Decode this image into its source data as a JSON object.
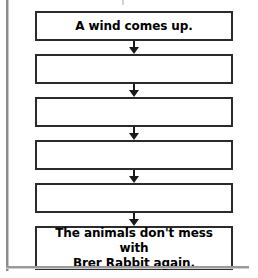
{
  "page": {
    "background_color": "#ffffff",
    "border_color": "#2b2b2b",
    "text_color": "#000000",
    "arrow_color": "#1a1a1a"
  },
  "flowchart": {
    "type": "vertical-sequence",
    "box_count": 6,
    "arrow_count": 5,
    "arrow_direction": "down",
    "boxes": [
      {
        "index": 1,
        "text": "A wind comes up.",
        "filled": true,
        "lines": 1
      },
      {
        "index": 2,
        "text": "",
        "filled": false,
        "lines": 1
      },
      {
        "index": 3,
        "text": "",
        "filled": false,
        "lines": 1
      },
      {
        "index": 4,
        "text": "",
        "filled": false,
        "lines": 1
      },
      {
        "index": 5,
        "text": "",
        "filled": false,
        "lines": 1
      },
      {
        "index": 6,
        "text": "The animals don't mess with\nBrer Rabbit again.",
        "filled": true,
        "lines": 2
      }
    ]
  },
  "artifacts": {
    "left_rule": "page-edge-line",
    "bottom_rule": "page-edge-line",
    "top_mark": "cropped-descender"
  }
}
